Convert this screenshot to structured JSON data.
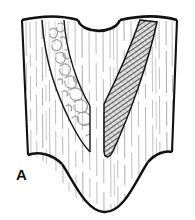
{
  "figure": {
    "panel_label": "A",
    "label_position": {
      "x": 16,
      "y": 180
    },
    "caption_text": "",
    "type": "line-drawing"
  },
  "colors": {
    "outline": "#111111",
    "background": "#ffffff",
    "striation": "#b9b9b9",
    "striation_dark": "#8f8f8f",
    "hatch": "#3a3a3a",
    "hatch_fill": "#d6d6d6",
    "squiggle": "#9a9a9a",
    "wedge_outline": "#1a1a1a",
    "label": "#111111"
  },
  "geometry": {
    "block": {
      "left_edge_top": {
        "x": 22,
        "y": 20
      },
      "left_edge_bottom": {
        "x": 28,
        "y": 155
      },
      "right_edge_top": {
        "x": 177,
        "y": 20
      },
      "right_edge_bottom": {
        "x": 172,
        "y": 152
      },
      "top_notch": {
        "start_x": 78,
        "end_x": 120,
        "depth_y": 29
      },
      "bottom_trough": {
        "start_x": 28,
        "end_x": 172,
        "depth_y": 212
      }
    },
    "left_wedge": {
      "top_x": 42,
      "apex": {
        "x": 92,
        "y": 152
      },
      "texture": "contorted-squiggle"
    },
    "right_wedge": {
      "top_x": 140,
      "apex": {
        "x": 106,
        "y": 155
      },
      "texture": "diagonal-hatch"
    }
  },
  "legend": {
    "striation_label": "vertical lamination",
    "squiggle_label": "contorted bedding",
    "hatch_label": "cross-hatched fill"
  },
  "striations": {
    "count": 26,
    "style": "dashed-vertical"
  }
}
